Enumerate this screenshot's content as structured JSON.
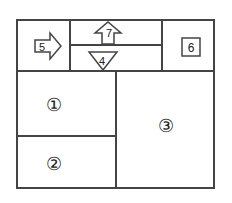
{
  "diagram": {
    "regions": [
      {
        "id": "1",
        "label": "①"
      },
      {
        "id": "2",
        "label": "②"
      },
      {
        "id": "3",
        "label": "③"
      },
      {
        "id": "4",
        "label": "4",
        "shape": "down-triangle"
      },
      {
        "id": "5",
        "label": "5",
        "shape": "right-arrow"
      },
      {
        "id": "6",
        "label": "6",
        "shape": "square"
      },
      {
        "id": "7",
        "label": "7",
        "shape": "up-arrow"
      }
    ]
  }
}
